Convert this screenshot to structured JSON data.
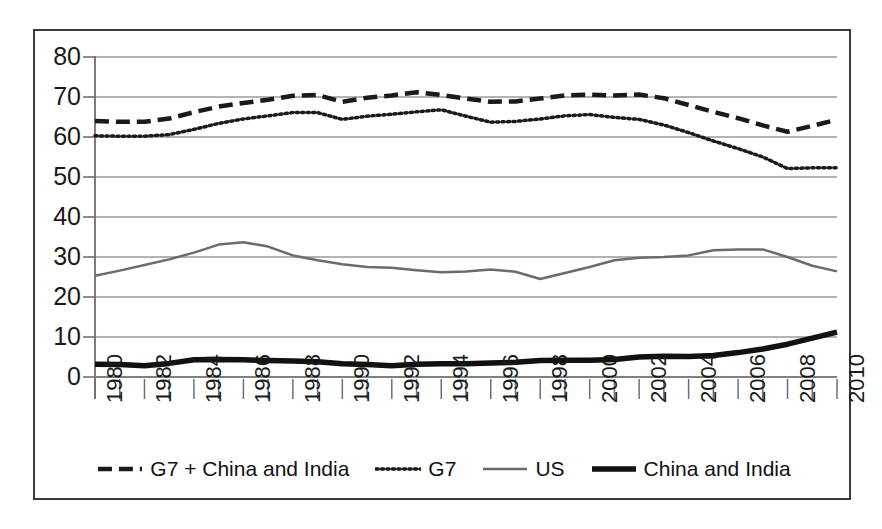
{
  "chart_data": {
    "type": "line",
    "title": "",
    "xlabel": "",
    "ylabel": "",
    "xlim": [
      1980,
      2010
    ],
    "ylim": [
      0,
      80
    ],
    "ytick_step": 10,
    "yticks": [
      "0",
      "10",
      "20",
      "30",
      "40",
      "50",
      "60",
      "70",
      "80"
    ],
    "xticks": [
      "1980",
      "1982",
      "1984",
      "1986",
      "1988",
      "1990",
      "1992",
      "1994",
      "1996",
      "1998",
      "2000",
      "2002",
      "2004",
      "2006",
      "2008",
      "2010"
    ],
    "xtick_rotation": -90,
    "grid": "horizontal",
    "legend_position": "bottom",
    "x": [
      1980,
      1981,
      1982,
      1983,
      1984,
      1985,
      1986,
      1987,
      1988,
      1989,
      1990,
      1991,
      1992,
      1993,
      1994,
      1995,
      1996,
      1997,
      1998,
      1999,
      2000,
      2001,
      2002,
      2003,
      2004,
      2005,
      2006,
      2007,
      2008,
      2009,
      2010
    ],
    "series": [
      {
        "name": "G7 + China and India",
        "style": "dashed",
        "color": "#1a1a1a",
        "width": 4.5,
        "values": [
          64.0,
          63.8,
          63.8,
          64.6,
          66.2,
          67.6,
          68.5,
          69.3,
          70.3,
          70.5,
          68.8,
          69.8,
          70.4,
          71.2,
          70.5,
          69.6,
          68.8,
          68.9,
          69.6,
          70.4,
          70.6,
          70.4,
          70.6,
          69.7,
          68.0,
          66.3,
          64.7,
          62.9,
          61.3,
          62.8,
          64.3
        ]
      },
      {
        "name": "G7",
        "style": "dotted",
        "color": "#1a1a1a",
        "width": 3.5,
        "values": [
          60.3,
          60.2,
          60.2,
          60.6,
          61.9,
          63.4,
          64.5,
          65.3,
          66.1,
          66.1,
          64.4,
          65.2,
          65.7,
          66.3,
          66.8,
          65.2,
          63.7,
          63.9,
          64.5,
          65.3,
          65.6,
          64.9,
          64.4,
          63.0,
          61.1,
          59.0,
          57.1,
          55.0,
          52.1,
          52.3,
          52.3
        ]
      },
      {
        "name": "US",
        "style": "solid",
        "color": "#6b6b6b",
        "width": 2.5,
        "values": [
          25.3,
          26.6,
          28.0,
          29.4,
          31.1,
          33.1,
          33.7,
          32.6,
          30.4,
          29.2,
          28.2,
          27.5,
          27.3,
          26.7,
          26.2,
          26.4,
          26.9,
          26.3,
          24.5,
          26.0,
          27.5,
          29.2,
          29.8,
          30.0,
          30.4,
          31.7,
          31.9,
          31.9,
          30.0,
          27.8,
          26.4
        ]
      },
      {
        "name": "China and India",
        "style": "solid",
        "color": "#111111",
        "width": 5.5,
        "values": [
          3.2,
          3.1,
          2.8,
          3.4,
          4.3,
          4.4,
          4.3,
          4.1,
          4.0,
          3.8,
          3.3,
          3.1,
          2.8,
          3.2,
          3.3,
          3.3,
          3.5,
          3.7,
          4.1,
          4.2,
          4.2,
          4.4,
          5.0,
          5.2,
          5.1,
          5.4,
          6.1,
          7.0,
          8.2,
          9.7,
          11.2
        ]
      }
    ]
  },
  "legend": {
    "items": [
      {
        "label": "G7 + China and India",
        "swatch": "dashed-line-swatch"
      },
      {
        "label": "G7",
        "swatch": "dotted-line-swatch"
      },
      {
        "label": "US",
        "swatch": "solid-gray-line-swatch"
      },
      {
        "label": "China and India",
        "swatch": "solid-thick-line-swatch"
      }
    ]
  }
}
